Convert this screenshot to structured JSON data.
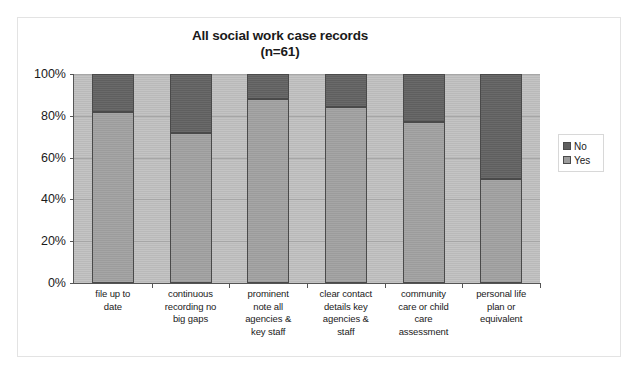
{
  "chart_data": {
    "type": "bar",
    "subtype": "stacked-100-percent",
    "title": "All social work case records",
    "subtitle": "(n=61)",
    "xlabel": "",
    "ylabel": "",
    "ylim": [
      0,
      100
    ],
    "ytick_labels": [
      "0%",
      "20%",
      "40%",
      "60%",
      "80%",
      "100%"
    ],
    "ytick_values": [
      0,
      20,
      40,
      60,
      80,
      100
    ],
    "grid": true,
    "legend_position": "right",
    "categories": [
      "file  up to date",
      "continuous recording no big gaps",
      "prominent note  all agencies & key staff",
      "clear contact details key agencies & staff",
      "community care or child care assessment",
      "personal life plan or equivalent"
    ],
    "category_lines": [
      [
        "file  up to",
        "date"
      ],
      [
        "continuous",
        "recording no",
        "big gaps"
      ],
      [
        "prominent",
        "note  all",
        "agencies &",
        "key staff"
      ],
      [
        "clear contact",
        "details key",
        "agencies &",
        "staff"
      ],
      [
        "community",
        "care or child",
        "care",
        "assessment"
      ],
      [
        "personal life",
        "plan or",
        "equivalent"
      ]
    ],
    "series": [
      {
        "name": "Yes",
        "color": "#9c9c9c",
        "values": [
          82,
          72,
          88,
          84,
          77,
          50
        ]
      },
      {
        "name": "No",
        "color": "#5f5f5f",
        "values": [
          18,
          28,
          12,
          16,
          23,
          50
        ]
      }
    ]
  },
  "legend": {
    "items": [
      {
        "label": "No",
        "swatch": "legend-swatch-no"
      },
      {
        "label": "Yes",
        "swatch": "legend-swatch-yes"
      }
    ]
  },
  "colors": {
    "plot_background": "#b9b9b9",
    "figure_background": "#ffffff",
    "axis": "#555555",
    "gridline": "#a6a6a6",
    "bar_border": "#4a4a4a",
    "text": "#1a1a1a"
  }
}
